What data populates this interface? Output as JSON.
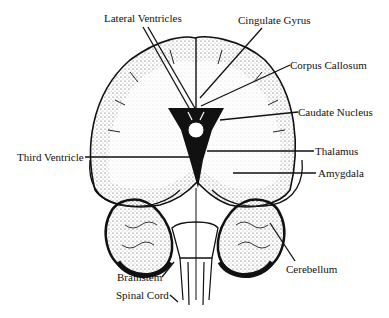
{
  "diagram": {
    "labels": {
      "lateral_ventricles": "Lateral Ventricles",
      "cingulate_gyrus": "Cingulate Gyrus",
      "corpus_callosum": "Corpus Callosum",
      "caudate_nucleus": "Caudate Nucleus",
      "third_ventricle": "Third Ventricle",
      "thalamus": "Thalamus",
      "amygdala": "Amygdala",
      "cerebellum": "Cerebellum",
      "brainstem": "Brainstem",
      "spinal_cord": "Spinal Cord"
    },
    "colors": {
      "ink": "#111111",
      "background": "#ffffff",
      "stipple": "#555555"
    }
  }
}
